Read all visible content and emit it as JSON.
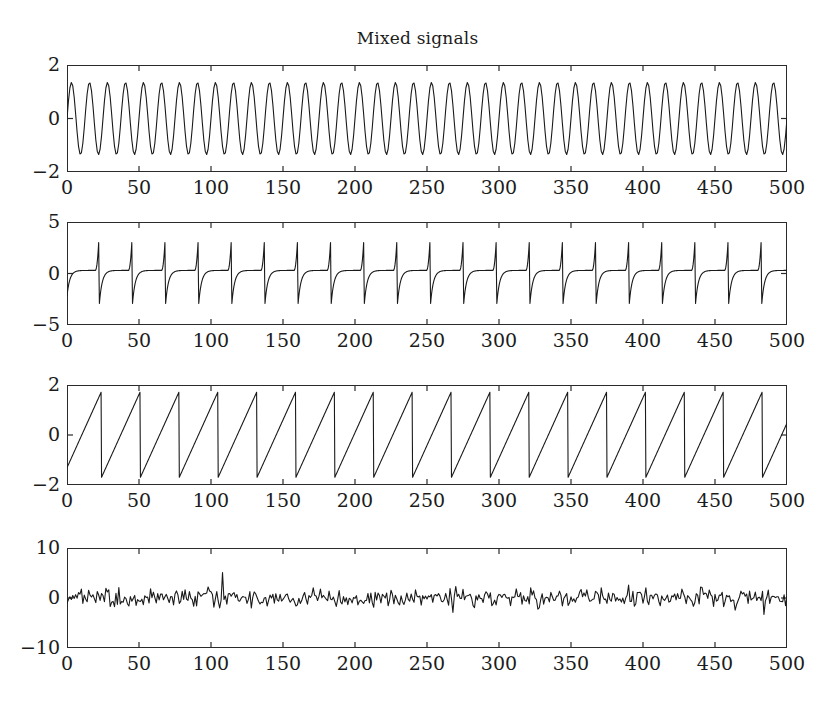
{
  "figure": {
    "title": "Mixed signals",
    "width": 835,
    "height": 715,
    "background": "#ffffff",
    "line_color": "#1a1a1a",
    "axis_color": "#2b2b2b"
  },
  "chart_data": [
    {
      "type": "line",
      "name": "sine-signal",
      "title": "Mixed signals",
      "xlabel": "",
      "ylabel": "",
      "xlim": [
        0,
        500
      ],
      "ylim": [
        -2,
        2
      ],
      "xticks": [
        0,
        50,
        100,
        150,
        200,
        250,
        300,
        350,
        400,
        450,
        500
      ],
      "xticklabels": [
        "0",
        "50",
        "100",
        "150",
        "200",
        "250",
        "300",
        "350",
        "400",
        "450",
        "500"
      ],
      "yticks": [
        -2,
        0,
        2
      ],
      "yticklabels": [
        "-2",
        "0",
        "2"
      ],
      "grid": false,
      "legend": "none",
      "signal": {
        "kind": "sine",
        "amplitude": 1.35,
        "period": 12.5,
        "phase": 0.0,
        "offset": 0.0,
        "samples": 500
      }
    },
    {
      "type": "line",
      "name": "spike-signal",
      "title": "",
      "xlabel": "",
      "ylabel": "",
      "xlim": [
        0,
        500
      ],
      "ylim": [
        -5,
        5
      ],
      "xticks": [
        0,
        50,
        100,
        150,
        200,
        250,
        300,
        350,
        400,
        450,
        500
      ],
      "xticklabels": [
        "0",
        "50",
        "100",
        "150",
        "200",
        "250",
        "300",
        "350",
        "400",
        "450",
        "500"
      ],
      "yticks": [
        -5,
        0,
        5
      ],
      "yticklabels": [
        "-5",
        "0",
        "5"
      ],
      "grid": false,
      "legend": "none",
      "signal": {
        "kind": "spike-train",
        "peak_high": 3.0,
        "peak_low": -3.0,
        "baseline": 0.3,
        "period": 23.0,
        "first_peak_x": 22.0,
        "samples": 500
      }
    },
    {
      "type": "line",
      "name": "sawtooth-signal",
      "title": "",
      "xlabel": "",
      "ylabel": "",
      "xlim": [
        0,
        500
      ],
      "ylim": [
        -2,
        2
      ],
      "xticks": [
        0,
        50,
        100,
        150,
        200,
        250,
        300,
        350,
        400,
        450,
        500
      ],
      "xticklabels": [
        "0",
        "50",
        "100",
        "150",
        "200",
        "250",
        "300",
        "350",
        "400",
        "450",
        "500"
      ],
      "yticks": [
        -2,
        0,
        2
      ],
      "yticklabels": [
        "-2",
        "0",
        "2"
      ],
      "grid": false,
      "legend": "none",
      "signal": {
        "kind": "sawtooth",
        "amplitude": 1.72,
        "period": 27.0,
        "phase": 0.12,
        "samples": 500
      }
    },
    {
      "type": "line",
      "name": "noise-signal",
      "title": "",
      "xlabel": "",
      "ylabel": "",
      "xlim": [
        0,
        500
      ],
      "ylim": [
        -10,
        10
      ],
      "xticks": [
        0,
        50,
        100,
        150,
        200,
        250,
        300,
        350,
        400,
        450,
        500
      ],
      "xticklabels": [
        "0",
        "50",
        "100",
        "150",
        "200",
        "250",
        "300",
        "350",
        "400",
        "450",
        "500"
      ],
      "yticks": [
        -10,
        0,
        10
      ],
      "yticklabels": [
        "-10",
        "0",
        "10"
      ],
      "grid": false,
      "legend": "none",
      "signal": {
        "kind": "gaussian-noise",
        "mean": 0.0,
        "std": 0.95,
        "outlier_x": 108,
        "outlier_y": 5.1,
        "samples": 500
      }
    }
  ]
}
